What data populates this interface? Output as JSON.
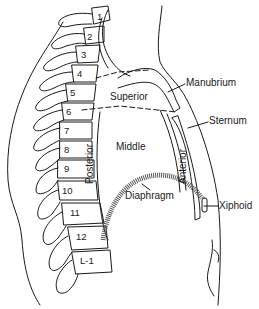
{
  "diagram": {
    "type": "anatomical-line-drawing",
    "regions": {
      "superior": "Superior",
      "middle": "Middle",
      "posterior": "Posterior",
      "anterior": "Anterior"
    },
    "structures": {
      "manubrium": "Manubrium",
      "sternum": "Sternum",
      "xiphoid": "Xiphoid",
      "diaphragm": "Diaphragm"
    },
    "vertebrae": [
      {
        "label": "1",
        "x": 97,
        "y": 12
      },
      {
        "label": "2",
        "x": 87,
        "y": 32
      },
      {
        "label": "3",
        "x": 79,
        "y": 50
      },
      {
        "label": "4",
        "x": 75,
        "y": 69
      },
      {
        "label": "5",
        "x": 68,
        "y": 88
      },
      {
        "label": "6",
        "x": 64,
        "y": 107
      },
      {
        "label": "7",
        "x": 62,
        "y": 126
      },
      {
        "label": "8",
        "x": 62,
        "y": 145
      },
      {
        "label": "9",
        "x": 62,
        "y": 164
      },
      {
        "label": "10",
        "x": 61,
        "y": 186
      },
      {
        "label": "11",
        "x": 67,
        "y": 208
      },
      {
        "label": "12",
        "x": 74,
        "y": 231
      },
      {
        "label": "L-1",
        "x": 78,
        "y": 254
      }
    ],
    "colors": {
      "line": "#1a1a1a",
      "background": "#ffffff"
    }
  }
}
